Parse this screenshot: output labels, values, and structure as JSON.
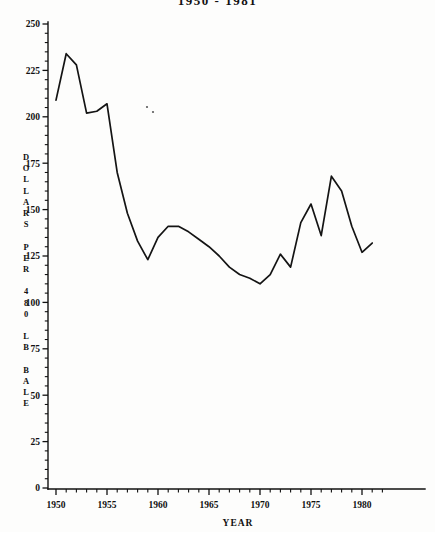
{
  "chart_data": {
    "type": "line",
    "title": "1950 - 1981",
    "xlabel": "YEAR",
    "ylabel": "DOLLARS PER 480 LB BALE",
    "ylabel_letters": [
      "D",
      "O",
      "L",
      "L",
      "A",
      "R",
      "S",
      "",
      "P",
      "E",
      "R",
      "",
      "4",
      "8",
      "0",
      "",
      "L",
      "B",
      "",
      "B",
      "A",
      "L",
      "E"
    ],
    "xlim": [
      1949,
      1982
    ],
    "ylim": [
      0,
      250
    ],
    "yticks": [
      0,
      25,
      50,
      75,
      100,
      125,
      150,
      175,
      200,
      225,
      250
    ],
    "ytick_labels": [
      "0",
      "25",
      "50",
      "75",
      "100",
      "125",
      "150",
      "175",
      "200",
      "225",
      "250"
    ],
    "ytick_minor_step": 5,
    "xticks": [
      1950,
      1955,
      1960,
      1965,
      1970,
      1975,
      1980
    ],
    "xtick_labels": [
      "1950",
      "1955",
      "1960",
      "1965",
      "1970",
      "1975",
      "1980"
    ],
    "xtick_minor_step": 1,
    "grid": false,
    "legend": false,
    "x": [
      1950,
      1951,
      1952,
      1953,
      1954,
      1955,
      1956,
      1957,
      1958,
      1959,
      1960,
      1961,
      1962,
      1963,
      1964,
      1965,
      1966,
      1967,
      1968,
      1969,
      1970,
      1971,
      1972,
      1973,
      1974,
      1975,
      1976,
      1977,
      1978,
      1979,
      1980,
      1981
    ],
    "values": [
      209,
      234,
      228,
      202,
      203,
      207,
      170,
      148,
      133,
      123,
      135,
      141,
      141,
      138,
      134,
      130,
      125,
      119,
      115,
      113,
      110,
      115,
      126,
      119,
      143,
      153,
      136,
      168,
      160,
      141,
      127,
      132
    ],
    "series": [
      {
        "name": "Price per 480 lb bale",
        "values": [
          209,
          234,
          228,
          202,
          203,
          207,
          170,
          148,
          133,
          123,
          135,
          141,
          141,
          138,
          134,
          130,
          125,
          119,
          115,
          113,
          110,
          115,
          126,
          119,
          143,
          153,
          136,
          168,
          160,
          141,
          127,
          132
        ]
      }
    ],
    "style": {
      "line_color": "#141414",
      "background": "#fdfdfc",
      "axis_color": "#111111"
    }
  },
  "annotations": {
    "speck_marks": [
      {
        "x": 147,
        "y": 107
      },
      {
        "x": 153,
        "y": 112
      }
    ]
  }
}
